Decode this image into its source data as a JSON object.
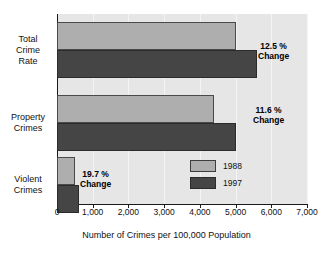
{
  "chart_data": {
    "type": "bar",
    "orientation": "horizontal",
    "title": "",
    "xlabel": "Number of Crimes per 100,000 Population",
    "ylabel": "",
    "xlim": [
      0,
      7000
    ],
    "xticks": [
      0,
      1000,
      2000,
      3000,
      4000,
      5000,
      6000,
      7000
    ],
    "xtick_labels": [
      "0",
      "1,000",
      "2,000",
      "3,000",
      "4,000",
      "5,000",
      "6,000",
      "7,000"
    ],
    "grid": true,
    "legend_position": "inside-lower-right",
    "categories": [
      "Total Crime Rate",
      "Property Crimes",
      "Violent Crimes"
    ],
    "category_labels": [
      [
        "Total",
        "Crime",
        "Rate"
      ],
      [
        "Property",
        "Crimes"
      ],
      [
        "Violent",
        "Crimes"
      ]
    ],
    "series": [
      {
        "name": "1988",
        "color": "#aeaeae",
        "values": [
          5000,
          4400,
          500
        ]
      },
      {
        "name": "1997",
        "color": "#454545",
        "values": [
          5600,
          5000,
          620
        ]
      }
    ],
    "annotations": [
      {
        "value": "12.5 %",
        "label": "Change",
        "category": "Total Crime Rate"
      },
      {
        "value": "11.6 %",
        "label": "Change",
        "category": "Property Crimes"
      },
      {
        "value": "19.7 %",
        "label": "Change",
        "category": "Violent Crimes"
      }
    ]
  },
  "legend": {
    "entries": [
      {
        "label": "1988",
        "color": "#aeaeae"
      },
      {
        "label": "1997",
        "color": "#454545"
      }
    ]
  },
  "colors": {
    "plot_background": "#e6e6e6",
    "gridline": "#f4f4f4",
    "axis": "#1a1a1a",
    "series_1988": "#aeaeae",
    "series_1997": "#454545",
    "text": "#111111"
  }
}
